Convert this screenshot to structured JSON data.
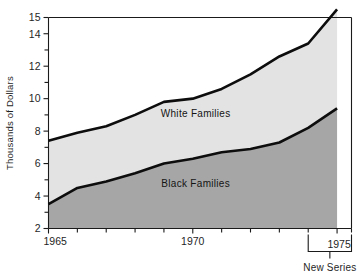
{
  "chart_data": {
    "type": "area",
    "title": "",
    "subtitle": "",
    "xlabel": "",
    "ylabel": "Thousands of Dollars",
    "xlim": [
      1965,
      1975.5
    ],
    "ylim": [
      2,
      15
    ],
    "grid": false,
    "legend_position": "inline-on-bands",
    "x": [
      1965,
      1966,
      1967,
      1968,
      1969,
      1970,
      1971,
      1972,
      1973,
      1974,
      1975
    ],
    "x_tick_labels": [
      "1965",
      "1970",
      "1975"
    ],
    "x_tick_values": [
      1965,
      1970,
      1975
    ],
    "x_minor_ticks": [
      1966,
      1967,
      1968,
      1969,
      1971,
      1972,
      1973,
      1974
    ],
    "y_tick_labels": [
      "2",
      "4",
      "6",
      "8",
      "10",
      "12",
      "14",
      "15"
    ],
    "y_tick_values": [
      2,
      4,
      6,
      8,
      10,
      12,
      14,
      15
    ],
    "y_minor_ticks": [
      3,
      5,
      7,
      9,
      11,
      13
    ],
    "series": [
      {
        "name": "White Families",
        "label": "White Families",
        "color": "#e3e3e3",
        "values": [
          7.4,
          7.9,
          8.3,
          9.0,
          9.8,
          10.0,
          10.6,
          11.5,
          12.6,
          13.4,
          15.5
        ]
      },
      {
        "name": "Black Families",
        "label": "Black Families",
        "color": "#a6a6a6",
        "values": [
          3.5,
          4.5,
          4.9,
          5.4,
          6.0,
          6.3,
          6.7,
          6.9,
          7.3,
          8.2,
          9.4
        ]
      }
    ],
    "annotations": [
      {
        "name": "new-series-note",
        "text": "New Series",
        "from_year": 1974,
        "to_year": 1975.5
      }
    ]
  },
  "axis": {
    "y_title": "Thousands of Dollars"
  },
  "labels": {
    "white_families": "White Families",
    "black_families": "Black Families",
    "new_series": "New Series",
    "year_1965": "1965",
    "year_1970": "1970",
    "year_1975": "1975",
    "y_2": "2",
    "y_4": "4",
    "y_6": "6",
    "y_8": "8",
    "y_10": "10",
    "y_12": "12",
    "y_14": "14",
    "y_15": "15"
  },
  "colors": {
    "white_band": "#e3e3e3",
    "black_band": "#a6a6a6",
    "line": "#0d0d0d",
    "axis": "#1a1a1a",
    "background": "#ffffff"
  }
}
